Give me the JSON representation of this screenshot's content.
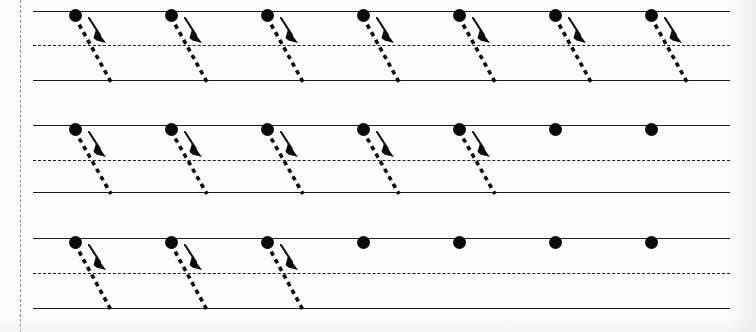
{
  "worksheet": {
    "title": "Handwriting Practice Worksheet",
    "description": "Three-line ruled handwriting practice sheet with guided diagonal down-stroke exercises",
    "page_width": 756,
    "page_height": 332,
    "background_color": "#fdfdfd",
    "ink_color": "#0b0b0b",
    "rule_color": "#1c1c1c",
    "margin_color": "#8e8e8e"
  },
  "margin": {
    "name": "left-margin-rule",
    "x": 20,
    "style": "dashed",
    "orientation": "vertical"
  },
  "ruling": {
    "left": 33,
    "width": 697,
    "line_styles": [
      "solid",
      "dashed",
      "solid"
    ],
    "line_names": [
      "top-line",
      "mid-line",
      "base-line"
    ]
  },
  "stroke_shape": {
    "name": "diagonal-down-stroke",
    "dot_diameter": 13,
    "run": 36,
    "dash_pattern": "4.5 4.2",
    "arrow_offset_x": 10,
    "arrow_offset_y": 2,
    "arrow_length": 22,
    "direction": "down-right"
  },
  "columns": {
    "first_x": 75,
    "spacing": 96,
    "count": 7,
    "positions": [
      75,
      171,
      267,
      363,
      459,
      555,
      651
    ]
  },
  "rows": [
    {
      "index": 1,
      "name": "practice-row-1",
      "top_y": 11,
      "mid_y": 45,
      "base_y": 80,
      "guided_count": 7,
      "marks": [
        {
          "type": "stroke"
        },
        {
          "type": "stroke"
        },
        {
          "type": "stroke"
        },
        {
          "type": "stroke"
        },
        {
          "type": "stroke"
        },
        {
          "type": "stroke"
        },
        {
          "type": "stroke"
        }
      ]
    },
    {
      "index": 2,
      "name": "practice-row-2",
      "top_y": 125,
      "mid_y": 160,
      "base_y": 192,
      "guided_count": 5,
      "marks": [
        {
          "type": "stroke"
        },
        {
          "type": "stroke"
        },
        {
          "type": "stroke"
        },
        {
          "type": "stroke"
        },
        {
          "type": "stroke"
        },
        {
          "type": "dot"
        },
        {
          "type": "dot"
        }
      ]
    },
    {
      "index": 3,
      "name": "practice-row-3",
      "top_y": 238,
      "mid_y": 273,
      "base_y": 308,
      "guided_count": 3,
      "marks": [
        {
          "type": "stroke"
        },
        {
          "type": "stroke"
        },
        {
          "type": "stroke"
        },
        {
          "type": "dot"
        },
        {
          "type": "dot"
        },
        {
          "type": "dot"
        },
        {
          "type": "dot"
        }
      ]
    }
  ]
}
